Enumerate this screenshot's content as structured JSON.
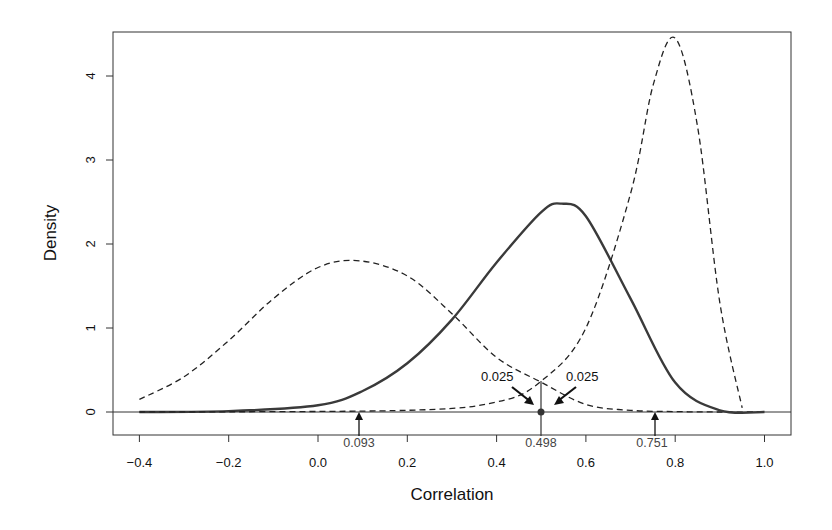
{
  "chart_data": {
    "type": "line",
    "title": "",
    "xlabel": "Correlation",
    "ylabel": "Density",
    "xlim": [
      -0.45,
      1.05
    ],
    "ylim": [
      -0.25,
      4.5
    ],
    "grid": false,
    "x_ticks": [
      "-0.4",
      "-0.2",
      "0.0",
      "0.2",
      "0.4",
      "0.6",
      "0.8",
      "1.0"
    ],
    "x_tick_values": [
      -0.4,
      -0.2,
      0.0,
      0.2,
      0.4,
      0.6,
      0.8,
      1.0
    ],
    "y_ticks": [
      "0",
      "1",
      "2",
      "3",
      "4"
    ],
    "y_tick_values": [
      0,
      1,
      2,
      3,
      4
    ],
    "series": [
      {
        "name": "Lower bound sampling distribution",
        "style": "dashed",
        "x": [
          -0.4,
          -0.3,
          -0.2,
          -0.1,
          0.0,
          0.093,
          0.2,
          0.3,
          0.4,
          0.498,
          0.6,
          0.7,
          0.8,
          0.9,
          1.0
        ],
        "y": [
          0.15,
          0.42,
          0.85,
          1.35,
          1.72,
          1.8,
          1.62,
          1.17,
          0.65,
          0.36,
          0.09,
          0.02,
          0.005,
          0.0,
          0.0
        ]
      },
      {
        "name": "Observed correlation sampling distribution",
        "style": "solid",
        "x": [
          -0.4,
          -0.2,
          0.0,
          0.1,
          0.2,
          0.3,
          0.4,
          0.5,
          0.545,
          0.6,
          0.7,
          0.8,
          0.9,
          1.0
        ],
        "y": [
          0.0,
          0.01,
          0.08,
          0.25,
          0.58,
          1.1,
          1.78,
          2.38,
          2.48,
          2.33,
          1.35,
          0.35,
          0.02,
          0.0
        ],
        "peak": {
          "x": 0.545,
          "y": 2.48
        }
      },
      {
        "name": "Upper bound sampling distribution",
        "style": "dashed",
        "x": [
          -0.4,
          0.2,
          0.4,
          0.498,
          0.6,
          0.7,
          0.751,
          0.8,
          0.85,
          0.9,
          0.95
        ],
        "y": [
          0.0,
          0.02,
          0.12,
          0.36,
          1.0,
          2.6,
          3.9,
          4.45,
          3.4,
          1.3,
          0.05
        ],
        "peak": {
          "x": 0.782,
          "y": 4.45
        }
      }
    ],
    "annotations": [
      {
        "text": "0.093",
        "x": 0.093,
        "type": "arrow-up",
        "label": "lower CI bound"
      },
      {
        "text": "0.498",
        "x": 0.498,
        "type": "point",
        "label": "observed correlation"
      },
      {
        "text": "0.751",
        "x": 0.751,
        "type": "arrow-up",
        "label": "upper CI bound"
      },
      {
        "text": "0.025",
        "side": "left",
        "type": "tail-area"
      },
      {
        "text": "0.025",
        "side": "right",
        "type": "tail-area"
      }
    ]
  },
  "labels": {
    "xlabel": "Correlation",
    "ylabel": "Density",
    "lower": "0.093",
    "point": "0.498",
    "upper": "0.751",
    "tail_left": "0.025",
    "tail_right": "0.025"
  },
  "colors": {
    "solid": "#3a3a3a",
    "dashed": "#222222",
    "axis": "#222222"
  }
}
